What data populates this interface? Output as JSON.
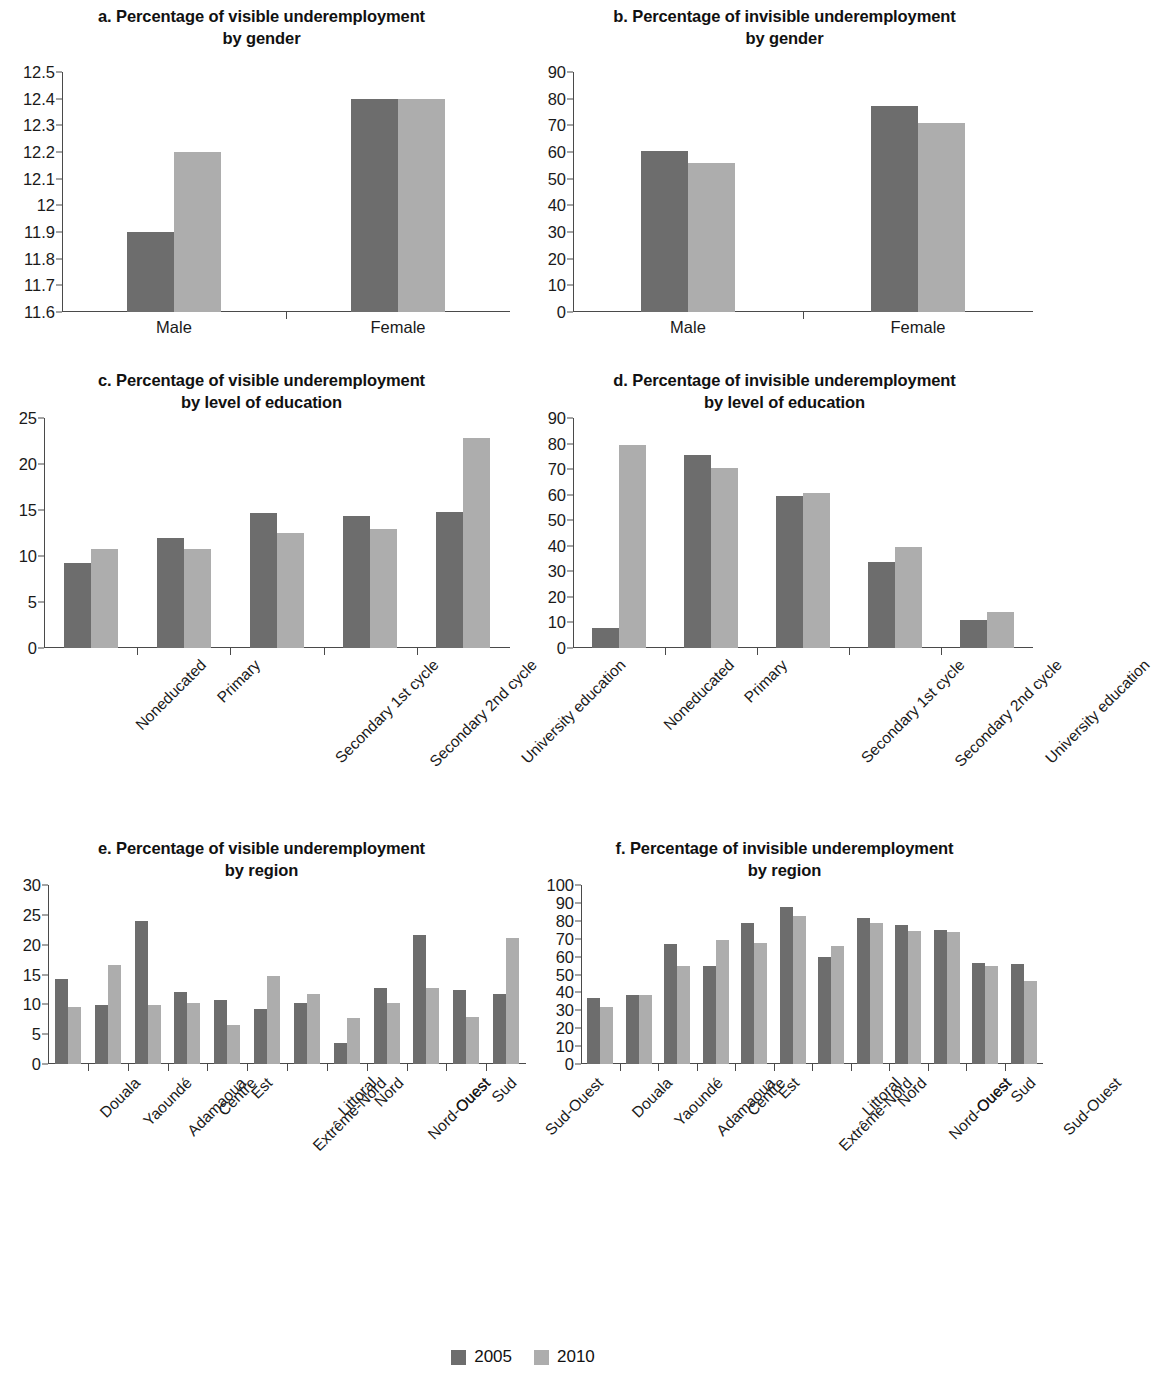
{
  "legend": {
    "series": [
      {
        "name": "2005",
        "color": "#6d6d6d"
      },
      {
        "name": "2010",
        "color": "#adadad"
      }
    ]
  },
  "colors": {
    "series_2005": "#6d6d6d",
    "series_2010": "#adadad",
    "axis": "#4a4a4a",
    "text": "#1a1a1a",
    "background": "#ffffff"
  },
  "panels": {
    "a": {
      "title_line1": "a. Percentage of visible underemployment",
      "title_line2": "by gender"
    },
    "b": {
      "title_line1": "b. Percentage of invisible underemployment",
      "title_line2": "by gender"
    },
    "c": {
      "title_line1": "c. Percentage of visible underemployment",
      "title_line2": "by level of education"
    },
    "d": {
      "title_line1": "d. Percentage of invisible underemployment",
      "title_line2": "by level of education"
    },
    "e": {
      "title_line1": "e. Percentage of visible underemployment",
      "title_line2": "by region"
    },
    "f": {
      "title_line1": "f. Percentage of invisible underemployment",
      "title_line2": "by region"
    }
  },
  "chart_data": [
    {
      "id": "a",
      "type": "bar",
      "title": "a. Percentage of visible underemployment by gender",
      "xlabel": "",
      "ylabel": "",
      "ylim": [
        11.6,
        12.5
      ],
      "yticks": [
        11.6,
        11.7,
        11.8,
        11.9,
        12,
        12.1,
        12.2,
        12.3,
        12.4,
        12.5
      ],
      "ytick_labels": [
        "11.6",
        "11.7",
        "11.8",
        "11.9",
        "12",
        "12.1",
        "12.2",
        "12.3",
        "12.4",
        "12.5"
      ],
      "grid": false,
      "legend_position": "bottom",
      "categories": [
        "Male",
        "Female"
      ],
      "series": [
        {
          "name": "2005",
          "values": [
            11.9,
            12.4
          ]
        },
        {
          "name": "2010",
          "values": [
            12.2,
            12.4
          ]
        }
      ]
    },
    {
      "id": "b",
      "type": "bar",
      "title": "b. Percentage of invisible underemployment by gender",
      "xlabel": "",
      "ylabel": "",
      "ylim": [
        0,
        90
      ],
      "yticks": [
        0,
        10,
        20,
        30,
        40,
        50,
        60,
        70,
        80,
        90
      ],
      "ytick_labels": [
        "0",
        "10",
        "20",
        "30",
        "40",
        "50",
        "60",
        "70",
        "80",
        "90"
      ],
      "grid": false,
      "legend_position": "bottom",
      "categories": [
        "Male",
        "Female"
      ],
      "series": [
        {
          "name": "2005",
          "values": [
            60.5,
            77.2
          ]
        },
        {
          "name": "2010",
          "values": [
            55.8,
            71.0
          ]
        }
      ]
    },
    {
      "id": "c",
      "type": "bar",
      "title": "c. Percentage of visible underemployment by level of education",
      "xlabel": "",
      "ylabel": "",
      "ylim": [
        0,
        25
      ],
      "yticks": [
        0,
        5,
        10,
        15,
        20,
        25
      ],
      "ytick_labels": [
        "0",
        "5",
        "10",
        "15",
        "20",
        "25"
      ],
      "grid": false,
      "legend_position": "bottom",
      "categories": [
        "Noneducated",
        "Primary",
        "Secondary 1st cycle",
        "Secondary 2nd cycle",
        "University education"
      ],
      "series": [
        {
          "name": "2005",
          "values": [
            9.2,
            12.0,
            14.7,
            14.4,
            14.8
          ]
        },
        {
          "name": "2010",
          "values": [
            10.8,
            10.8,
            12.5,
            12.9,
            22.8
          ]
        }
      ]
    },
    {
      "id": "d",
      "type": "bar",
      "title": "d. Percentage of invisible underemployment by level of education",
      "xlabel": "",
      "ylabel": "",
      "ylim": [
        0,
        90
      ],
      "yticks": [
        0,
        10,
        20,
        30,
        40,
        50,
        60,
        70,
        80,
        90
      ],
      "ytick_labels": [
        "0",
        "10",
        "20",
        "30",
        "40",
        "50",
        "60",
        "70",
        "80",
        "90"
      ],
      "grid": false,
      "legend_position": "bottom",
      "categories": [
        "Noneducated",
        "Primary",
        "Secondary 1st cycle",
        "Secondary 2nd cycle",
        "University education"
      ],
      "series": [
        {
          "name": "2005",
          "values": [
            7.9,
            75.6,
            59.4,
            33.6,
            10.8
          ]
        },
        {
          "name": "2010",
          "values": [
            79.4,
            70.3,
            60.5,
            39.5,
            14.2
          ]
        }
      ]
    },
    {
      "id": "e",
      "type": "bar",
      "title": "e. Percentage of visible underemployment by region",
      "xlabel": "",
      "ylabel": "",
      "ylim": [
        0,
        30
      ],
      "yticks": [
        0,
        5,
        10,
        15,
        20,
        25,
        30
      ],
      "ytick_labels": [
        "0",
        "5",
        "10",
        "15",
        "20",
        "25",
        "30"
      ],
      "grid": false,
      "legend_position": "bottom",
      "categories": [
        "Douala",
        "Yaoundé",
        "Adamaoua",
        "Centre",
        "Est",
        "Extrême-Nord",
        "Littoral",
        "Nord",
        "Nord-Ouest",
        "Ouest",
        "Sud",
        "Sud-Ouest"
      ],
      "series": [
        {
          "name": "2005",
          "values": [
            14.3,
            9.9,
            24.0,
            12.0,
            10.8,
            9.3,
            10.3,
            3.6,
            12.8,
            21.6,
            12.4,
            11.7
          ]
        },
        {
          "name": "2010",
          "values": [
            9.6,
            16.6,
            9.9,
            10.2,
            6.5,
            14.8,
            11.8,
            7.7,
            10.2,
            12.7,
            7.9,
            21.2
          ]
        }
      ]
    },
    {
      "id": "f",
      "type": "bar",
      "title": "f. Percentage of invisible underemployment by region",
      "xlabel": "",
      "ylabel": "",
      "ylim": [
        0,
        100
      ],
      "yticks": [
        0,
        10,
        20,
        30,
        40,
        50,
        60,
        70,
        80,
        90,
        100
      ],
      "ytick_labels": [
        "0",
        "10",
        "20",
        "30",
        "40",
        "50",
        "60",
        "70",
        "80",
        "90",
        "100"
      ],
      "grid": false,
      "legend_position": "bottom",
      "categories": [
        "Douala",
        "Yaoundé",
        "Adamaoua",
        "Centre",
        "Est",
        "Extrême-Nord",
        "Littoral",
        "Nord",
        "Nord-Ouest",
        "Ouest",
        "Sud",
        "Sud-Ouest"
      ],
      "series": [
        {
          "name": "2005",
          "values": [
            37.0,
            38.5,
            66.8,
            55.0,
            78.8,
            87.8,
            60.0,
            81.5,
            77.5,
            75.0,
            56.6,
            55.8
          ]
        },
        {
          "name": "2010",
          "values": [
            32.0,
            38.5,
            55.0,
            69.3,
            67.5,
            82.5,
            65.8,
            79.0,
            74.3,
            73.5,
            54.5,
            46.5
          ]
        }
      ]
    }
  ]
}
